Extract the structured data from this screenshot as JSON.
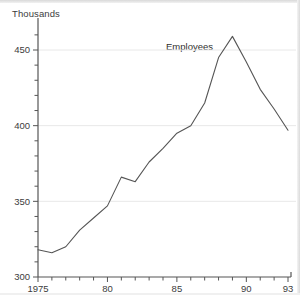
{
  "chart": {
    "unit_label": "Thousands",
    "series_label": "Employees"
  },
  "chart_data": {
    "type": "line",
    "title": "",
    "subtitle": "",
    "xlabel": "",
    "ylabel": "Thousands",
    "annotations": [
      {
        "text": "Employees",
        "x": 1986,
        "y": 452
      }
    ],
    "legend": "none",
    "grid": "horizontal",
    "xlim": [
      1975,
      1993
    ],
    "ylim": [
      300,
      465
    ],
    "ytick_labels": [
      "300",
      "350",
      "400",
      "450"
    ],
    "ytick_values": [
      300,
      350,
      400,
      450
    ],
    "y_minor_tick_step": 10,
    "xtick_labels": [
      "1975",
      "80",
      "85",
      "90",
      "93"
    ],
    "xtick_values": [
      1975,
      1980,
      1985,
      1990,
      1993
    ],
    "x_minor_tick_step": 1,
    "x": [
      1975,
      1976,
      1977,
      1978,
      1979,
      1980,
      1981,
      1982,
      1983,
      1984,
      1985,
      1986,
      1987,
      1988,
      1989,
      1990,
      1991,
      1992,
      1993
    ],
    "series": [
      {
        "name": "Employees",
        "color": "#555555",
        "values": [
          318,
          316,
          320,
          331,
          339,
          347,
          366,
          363,
          376,
          385,
          395,
          400,
          415,
          445,
          459,
          442,
          424,
          411,
          397
        ]
      }
    ]
  },
  "style": {
    "line_color": "#555555",
    "axis_color": "#555555",
    "grid_color": "#e8e8e8",
    "text_color": "#3c3c3c",
    "background": "#ffffff"
  }
}
